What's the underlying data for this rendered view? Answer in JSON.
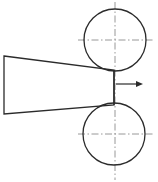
{
  "figure": {
    "background_color": "#ffffff",
    "width": 158,
    "height": 182,
    "line_color": "#2b2b2b",
    "centerline_color": "#8c8c8c"
  },
  "rollers": [
    {
      "name": "upper-roller",
      "label": "Upper roller",
      "cx": 115,
      "cy": 40,
      "r": 31,
      "stroke_width": 1.3
    },
    {
      "name": "lower-roller",
      "label": "Lower roller",
      "cx": 114,
      "cy": 134,
      "r": 31,
      "stroke_width": 1.3
    }
  ],
  "centerlines": {
    "dash_pattern": "7 2.5 1.5 2.5",
    "stroke_width": 0.9,
    "horizontal": [
      {
        "name": "upper-roller-horizontal-centerline",
        "x1": 78,
        "x2": 153,
        "y": 40
      },
      {
        "name": "lower-roller-horizontal-centerline",
        "x1": 78,
        "x2": 153,
        "y": 134
      }
    ],
    "vertical": [
      {
        "name": "rollers-vertical-centerline",
        "x": 115,
        "y1": 2,
        "y2": 180
      }
    ]
  },
  "wedge": {
    "label": "Tapered workpiece",
    "points": "4,56 114,70 114,105 4,114",
    "stroke_width": 1.3,
    "fill": "#ffffff"
  },
  "nip": {
    "label": "Roller nip line",
    "x": 114,
    "y1": 70,
    "y2": 105,
    "stroke_width": 1.4
  },
  "direction_arrow": {
    "label": "Feed direction",
    "x1": 116,
    "x2": 138,
    "y": 84,
    "stroke_width": 1.2,
    "head_points": "143,84 136,81 136,87"
  }
}
